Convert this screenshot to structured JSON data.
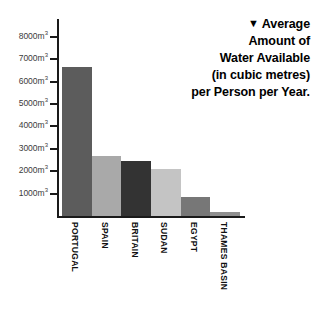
{
  "title": {
    "marker_icon": "down-triangle-icon",
    "marker_glyph": "▼",
    "lines": [
      "Average",
      "Amount of",
      "Water Available",
      "(in cubic metres)",
      "per Person per Year."
    ],
    "full_text": "Average Amount of Water Available (in cubic metres) per Person per Year."
  },
  "chart_data": {
    "type": "bar",
    "title": "Average Amount of Water Available (in cubic metres) per Person per Year.",
    "xlabel": "",
    "ylabel": "",
    "ylim": [
      0,
      8800
    ],
    "grid": false,
    "legend": "none",
    "unit": "m³",
    "categories": [
      "PORTUGAL",
      "SPAIN",
      "BRITAIN",
      "SUDAN",
      "EGYPT",
      "THAMES BASIN"
    ],
    "values": [
      6650,
      2700,
      2450,
      2100,
      850,
      200
    ],
    "colors": [
      "#5c5c5c",
      "#a9a9a9",
      "#333333",
      "#c4c4c4",
      "#777777",
      "#8f8f8f"
    ],
    "yticks": [
      1000,
      2000,
      3000,
      4000,
      5000,
      6000,
      7000,
      8000
    ],
    "ytick_labels": [
      "1000m³",
      "2000m³",
      "3000m³",
      "4000m³",
      "5000m³",
      "6000m³",
      "7000m³",
      "8000m³"
    ],
    "ytick_base": [
      "1000m",
      "2000m",
      "3000m",
      "4000m",
      "5000m",
      "6000m",
      "7000m",
      "8000m"
    ],
    "ytick_sup": "3"
  },
  "axis": {
    "axis_color": "#1a1a1a",
    "label_color": "#3b3b3b"
  }
}
